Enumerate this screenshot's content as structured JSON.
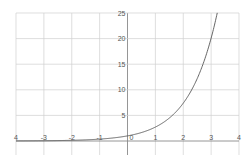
{
  "chart_data": {
    "type": "line",
    "title": "",
    "xlabel": "",
    "ylabel": "",
    "function": "y = e^x",
    "xlim": [
      -4,
      4
    ],
    "ylim": [
      -2.5,
      25
    ],
    "grid": true,
    "legend": null,
    "x_ticks": [
      -4,
      -3,
      -2,
      -1,
      0,
      1,
      2,
      3,
      4
    ],
    "x_tick_labels": [
      "4",
      "-3",
      "-2",
      "-1",
      "0",
      "1",
      "2",
      "3",
      "4"
    ],
    "y_ticks": [
      5,
      10,
      15,
      20,
      25
    ],
    "y_tick_labels": [
      "5",
      "10",
      "15",
      "20",
      "25"
    ],
    "series": [
      {
        "name": "e^x",
        "x": [
          -4,
          -3,
          -2,
          -1,
          0,
          0.5,
          1,
          1.5,
          2,
          2.5,
          3,
          3.22
        ],
        "y": [
          0.02,
          0.05,
          0.14,
          0.37,
          1.0,
          1.65,
          2.72,
          4.48,
          7.39,
          12.18,
          20.09,
          25.0
        ]
      }
    ]
  },
  "colors": {
    "grid": "#d0d0d0",
    "axis": "#8a8a8a",
    "curve": "#555555",
    "labels": "#555555"
  }
}
